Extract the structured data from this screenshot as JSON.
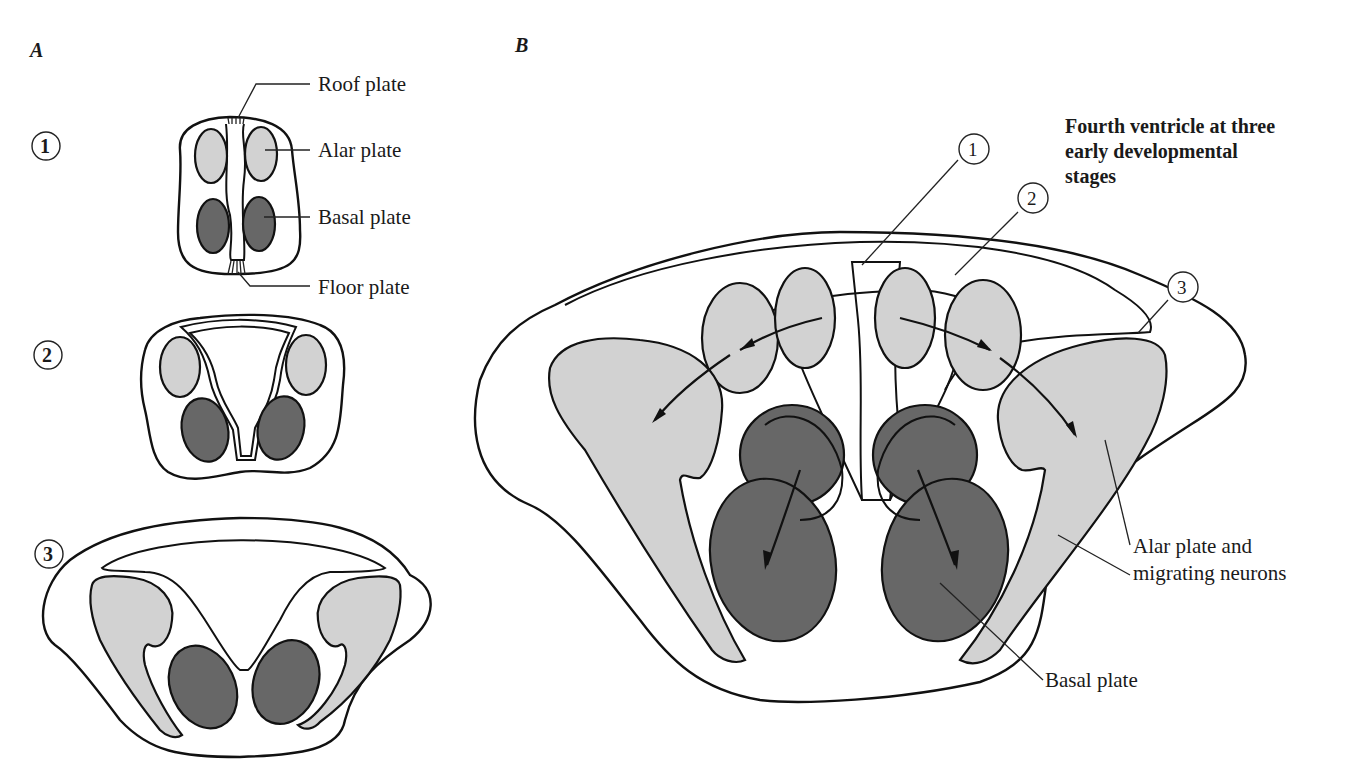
{
  "panels": {
    "A": {
      "letter": "A",
      "stages": [
        {
          "number": "1"
        },
        {
          "number": "2"
        },
        {
          "number": "3"
        }
      ],
      "labels": {
        "roof_plate": "Roof plate",
        "alar_plate": "Alar plate",
        "basal_plate": "Basal plate",
        "floor_plate": "Floor plate"
      }
    },
    "B": {
      "letter": "B",
      "title_lines": [
        "Fourth ventricle at three",
        "early developmental",
        "stages"
      ],
      "stage_markers": [
        "1",
        "2",
        "3"
      ],
      "labels": {
        "alar_migrating_line1": "Alar plate and",
        "alar_migrating_line2": "migrating neurons",
        "basal_plate": "Basal plate"
      }
    }
  },
  "colors": {
    "alar_fill": "#d2d2d2",
    "basal_fill": "#676767",
    "outline": "#111111",
    "background": "#ffffff"
  }
}
